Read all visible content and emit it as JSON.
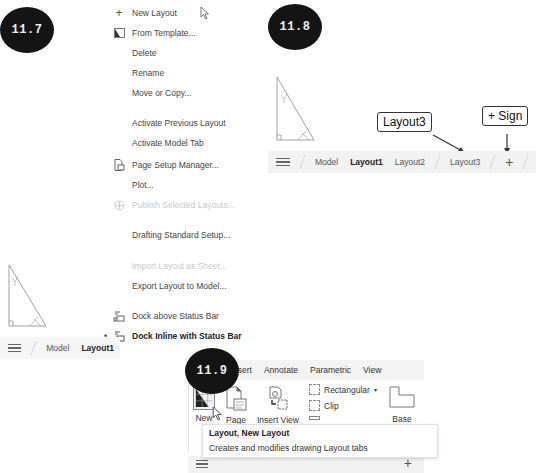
{
  "figures": {
    "fig_11_7": {
      "badge": "11.7"
    },
    "fig_11_8": {
      "badge": "11.8"
    },
    "fig_11_9": {
      "badge": "11.9"
    }
  },
  "context_menu": {
    "items": [
      {
        "label": "New Layout",
        "icon": "plus-icon",
        "state": "normal"
      },
      {
        "label": "From Template...",
        "icon": "template-icon",
        "state": "normal"
      },
      {
        "label": "Delete",
        "icon": null,
        "state": "normal"
      },
      {
        "label": "Rename",
        "icon": null,
        "state": "normal"
      },
      {
        "label": "Move or Copy...",
        "icon": null,
        "state": "normal"
      },
      {
        "label": "Activate Previous Layout",
        "icon": null,
        "state": "normal"
      },
      {
        "label": "Activate Model Tab",
        "icon": null,
        "state": "normal"
      },
      {
        "label": "Page Setup Manager...",
        "icon": "page-setup-icon",
        "state": "normal"
      },
      {
        "label": "Plot...",
        "icon": null,
        "state": "normal"
      },
      {
        "label": "Publish Selected Layouts...",
        "icon": "publish-icon",
        "state": "disabled"
      },
      {
        "label": "Drafting Standard Setup...",
        "icon": null,
        "state": "normal"
      },
      {
        "label": "Import Layout as Sheet...",
        "icon": null,
        "state": "disabled"
      },
      {
        "label": "Export Layout to Model...",
        "icon": null,
        "state": "normal"
      },
      {
        "label": "Dock above Status Bar",
        "icon": "dock-above-icon",
        "state": "normal"
      },
      {
        "label": "Dock Inline with Status Bar",
        "icon": "dock-inline-icon",
        "state": "checked"
      }
    ]
  },
  "statusbar_11_7": {
    "tabs": [
      "Model",
      "Layout1"
    ],
    "active": "Layout1"
  },
  "statusbar_11_8": {
    "tabs": [
      "Model",
      "Layout1",
      "Layout2",
      "Layout3"
    ],
    "active": "Layout1",
    "plus": "+"
  },
  "callouts": {
    "layout3": "Layout3",
    "plus_sign": "+ Sign"
  },
  "ribbon": {
    "tabs": [
      "Home",
      "Insert",
      "Annotate",
      "Parametric",
      "View"
    ],
    "buttons": {
      "new": "New",
      "page": "Page",
      "insert_view": "Insert View",
      "rectangular": "Rectangular",
      "clip": "Clip",
      "base": "Base"
    },
    "panel_label": "La",
    "tooltip": {
      "title": "Layout, New Layout",
      "description": "Creates and modifies drawing Layout tabs"
    },
    "plus": "+"
  }
}
